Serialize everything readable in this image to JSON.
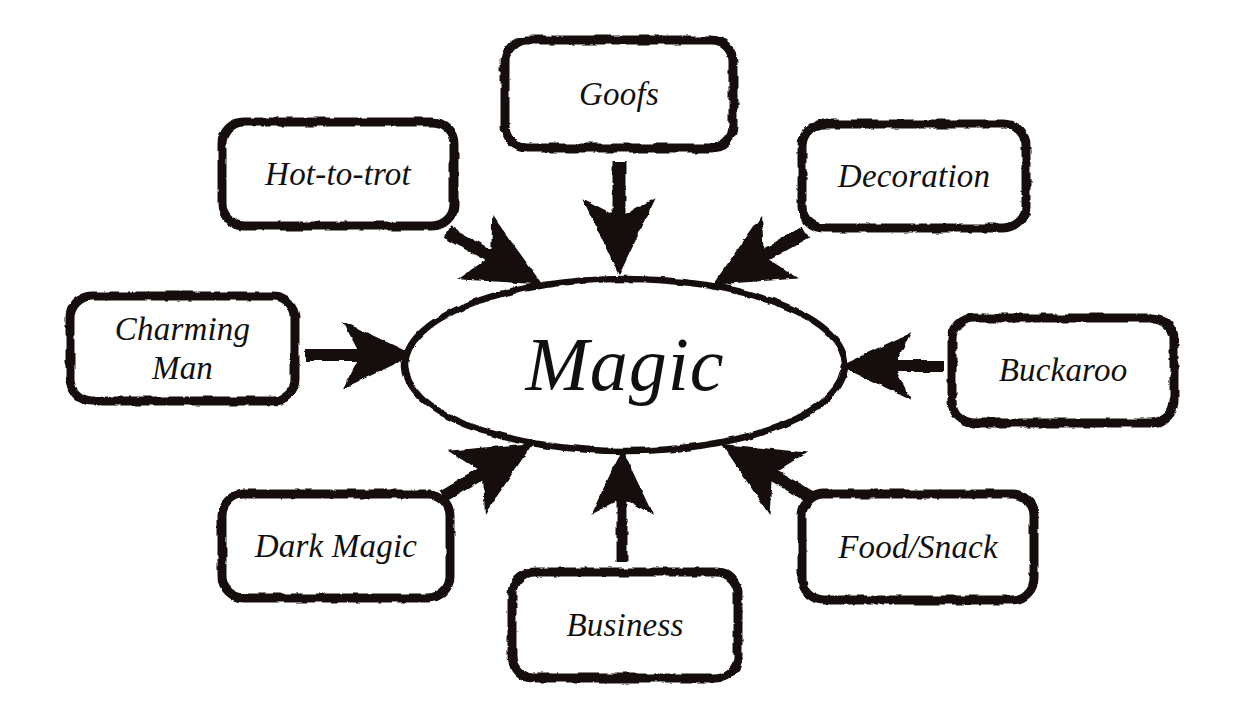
{
  "diagram": {
    "type": "concept-map",
    "style": "hand-drawn-sketch",
    "background_color": "#ffffff",
    "ink_color": "#12100f",
    "center": {
      "label": "Magic",
      "shape": "ellipse",
      "cx": 625,
      "cy": 365,
      "rx": 220,
      "ry": 86
    },
    "nodes": [
      {
        "id": "goofs",
        "label": "Goofs",
        "shape": "rounded-rectangle",
        "x": 505,
        "y": 40,
        "w": 228,
        "h": 108,
        "arrow_direction": "down",
        "arrow_label": "Goofs to Magic"
      },
      {
        "id": "hot-to-trot",
        "label": "Hot-to-trot",
        "shape": "rounded-rectangle",
        "x": 222,
        "y": 122,
        "w": 232,
        "h": 104,
        "arrow_direction": "down-right",
        "arrow_label": "Hot-to-trot to Magic"
      },
      {
        "id": "decoration",
        "label": "Decoration",
        "shape": "rounded-rectangle",
        "x": 802,
        "y": 124,
        "w": 224,
        "h": 104,
        "arrow_direction": "down-left",
        "arrow_label": "Decoration to Magic"
      },
      {
        "id": "charming-man",
        "label": "Charming\nMan",
        "shape": "rounded-rectangle",
        "x": 70,
        "y": 296,
        "w": 225,
        "h": 105,
        "arrow_direction": "right",
        "arrow_label": "Charming Man to Magic"
      },
      {
        "id": "buckaroo",
        "label": "Buckaroo",
        "shape": "rounded-rectangle",
        "x": 952,
        "y": 318,
        "w": 222,
        "h": 105,
        "arrow_direction": "left",
        "arrow_label": "Buckaroo to Magic"
      },
      {
        "id": "dark-magic",
        "label": "Dark Magic",
        "shape": "rounded-rectangle",
        "x": 222,
        "y": 494,
        "w": 228,
        "h": 104,
        "arrow_direction": "up-right",
        "arrow_label": "Dark Magic to Magic"
      },
      {
        "id": "business",
        "label": "Business",
        "shape": "rounded-rectangle",
        "x": 512,
        "y": 572,
        "w": 226,
        "h": 106,
        "arrow_direction": "up",
        "arrow_label": "Business to Magic"
      },
      {
        "id": "food-snack",
        "label": "Food/Snack",
        "shape": "rounded-rectangle",
        "x": 802,
        "y": 494,
        "w": 232,
        "h": 106,
        "arrow_direction": "up-left",
        "arrow_label": "Food/Snack to Magic"
      }
    ]
  }
}
